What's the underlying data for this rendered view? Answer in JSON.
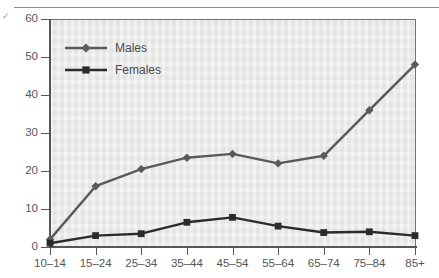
{
  "figure": {
    "edge_mark": "✓",
    "background_color": "#ffffff",
    "plot_background_color": "#e9e9e7",
    "axis_color": "#56565a"
  },
  "legend": {
    "position": "top-left-inside",
    "entries": [
      {
        "label": "Males",
        "marker": "diamond",
        "color": "#5a5a5c"
      },
      {
        "label": "Females",
        "marker": "square",
        "color": "#2b2b2d"
      }
    ]
  },
  "chart_data": {
    "type": "line",
    "title": "",
    "subtitle": "",
    "xlabel": "",
    "ylabel": "",
    "categories": [
      "10–14",
      "15–24",
      "25–34",
      "35–44",
      "45–54",
      "55–64",
      "65–74",
      "75–84",
      "85+"
    ],
    "series": [
      {
        "name": "Males",
        "marker": "diamond",
        "color": "#5a5a5c",
        "values": [
          2,
          16,
          20.5,
          23.5,
          24.5,
          22,
          24,
          36,
          48
        ]
      },
      {
        "name": "Females",
        "marker": "square",
        "color": "#2b2b2d",
        "values": [
          1,
          3,
          3.5,
          6.5,
          7.8,
          5.5,
          3.8,
          4,
          3
        ]
      }
    ],
    "ylim": [
      0,
      60
    ],
    "yticks": [
      0,
      10,
      20,
      30,
      40,
      50,
      60
    ],
    "ytick_labels": [
      "0",
      "10",
      "20",
      "30",
      "40",
      "50",
      "60"
    ],
    "grid": false,
    "legend_position": "upper left"
  }
}
